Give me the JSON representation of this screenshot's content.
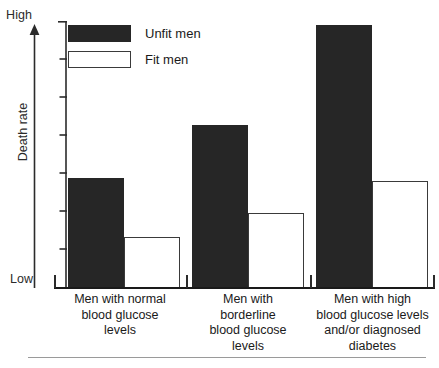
{
  "chart_data": {
    "type": "bar",
    "title": "",
    "xlabel": "",
    "ylabel": "Death rate",
    "ylim_labels": [
      "Low",
      "High"
    ],
    "grid": false,
    "legend_position": "top-left",
    "axis_note": "Y axis is unlabeled/qualitative: arrow from Low to High with 7 unlabelled tick marks",
    "y_tick_count": 7,
    "categories": [
      "Men with normal blood glucose levels",
      "Men with borderline blood glucose levels",
      "Men with high blood glucose levels and/or diagnosed diabetes"
    ],
    "category_lines": [
      [
        "Men with normal",
        "blood glucose",
        "levels"
      ],
      [
        "Men with",
        "borderline",
        "blood glucose",
        "levels"
      ],
      [
        "Men with high",
        "blood glucose levels",
        "and/or diagnosed",
        "diabetes"
      ]
    ],
    "series": [
      {
        "name": "Unfit men",
        "color": "#262626",
        "style": "filled",
        "values": [
          41,
          61,
          98
        ]
      },
      {
        "name": "Fit men",
        "color": "#ffffff",
        "style": "outline",
        "values": [
          19,
          28,
          40
        ]
      }
    ],
    "value_units": "percent of full axis height (relative death rate)"
  },
  "legend": {
    "items": [
      {
        "label": "Unfit men",
        "swatch": "filled-black"
      },
      {
        "label": "Fit men",
        "swatch": "outline-white"
      }
    ]
  },
  "axis": {
    "high_label": "High",
    "low_label": "Low",
    "title": "Death rate"
  },
  "colors": {
    "ink": "#1a1a1a",
    "bar_dark": "#262626",
    "bar_light": "#ffffff",
    "outline": "#3a3a3a",
    "rule": "#9a9a9a",
    "background": "#ffffff"
  }
}
